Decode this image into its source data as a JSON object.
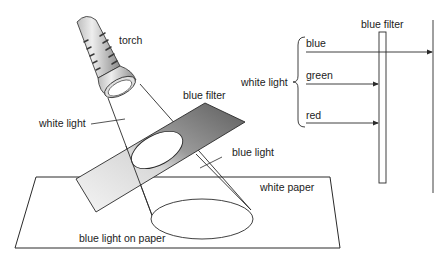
{
  "left_diagram": {
    "labels": {
      "torch": "torch",
      "white_light": "white light",
      "blue_filter": "blue filter",
      "blue_light": "blue light",
      "white_paper": "white paper",
      "blue_light_on_paper": "blue light on paper"
    }
  },
  "right_diagram": {
    "filter_label": "blue filter",
    "group_label": "white light",
    "rays": [
      {
        "label": "blue",
        "passes_filter": true
      },
      {
        "label": "green",
        "passes_filter": false
      },
      {
        "label": "red",
        "passes_filter": false
      }
    ]
  },
  "colors": {
    "line": "#2a2a2a",
    "filter_dark": "#6a6a6a",
    "filter_light": "#f2f2f2"
  }
}
